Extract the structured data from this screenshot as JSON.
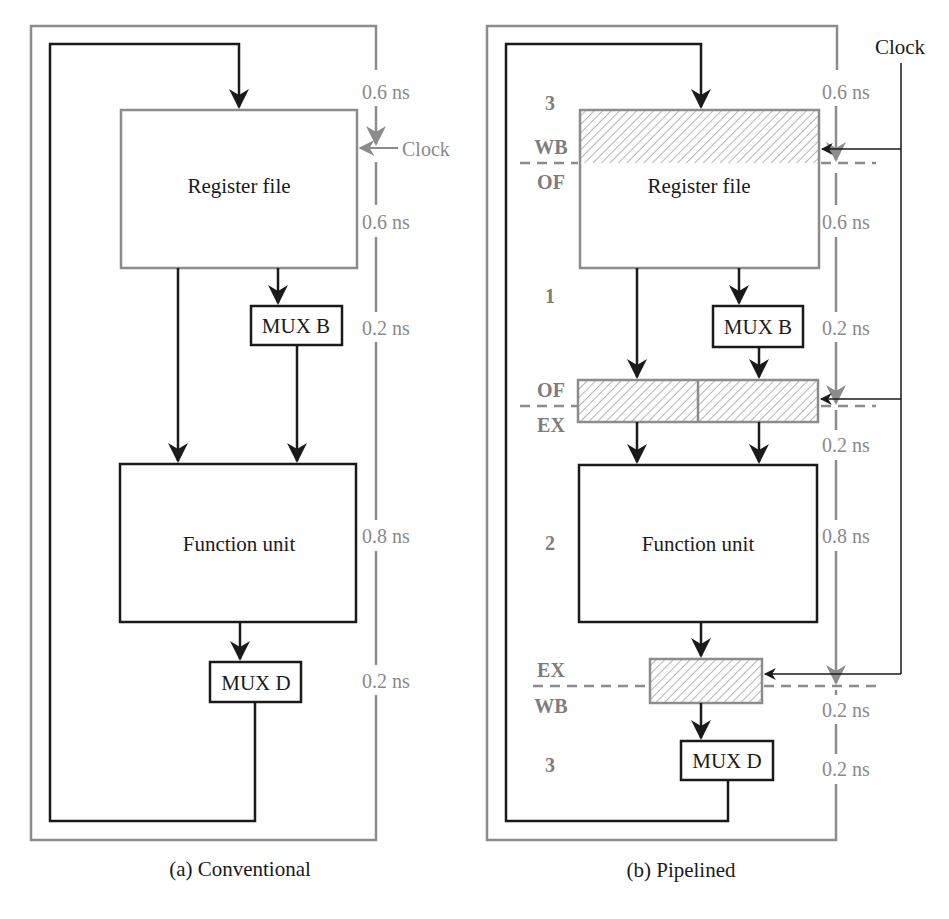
{
  "conventional": {
    "caption": "(a) Conventional",
    "register_file": "Register file",
    "mux_b": "MUX B",
    "function_unit": "Function unit",
    "mux_d": "MUX D",
    "clock": "Clock",
    "timings": [
      "0.6 ns",
      "0.6 ns",
      "0.2 ns",
      "0.8 ns",
      "0.2 ns"
    ]
  },
  "pipelined": {
    "caption": "(b) Pipelined",
    "register_file": "Register file",
    "mux_b": "MUX B",
    "function_unit": "Function unit",
    "mux_d": "MUX D",
    "clock": "Clock",
    "timings": [
      "0.6 ns",
      "0.6 ns",
      "0.2 ns",
      "0.2 ns",
      "0.8 ns",
      "0.2 ns",
      "0.2 ns"
    ],
    "stage_numbers": [
      "3",
      "1",
      "2",
      "3"
    ],
    "stage_boundaries": [
      {
        "above": "WB",
        "below": "OF"
      },
      {
        "above": "OF",
        "below": "EX"
      },
      {
        "above": "EX",
        "below": "WB"
      }
    ]
  },
  "colors": {
    "frame_gray": "#8c8c8c",
    "data_black": "#1a1a1a",
    "hatch_gray": "#8c8c8c"
  }
}
